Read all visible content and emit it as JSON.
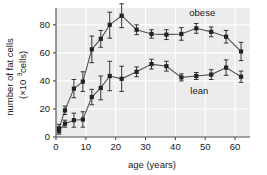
{
  "chart_data": {
    "type": "line",
    "title": "",
    "xlabel": "age (years)",
    "ylabel_line1": "number of fat cells",
    "ylabel_line2_pre": "(×10",
    "ylabel_line2_sup": "9",
    "ylabel_line2_post": " cells)",
    "ylabel_full": "number of fat cells (×10⁹ cells)",
    "xlim": [
      0,
      65
    ],
    "ylim": [
      0,
      92
    ],
    "xticks": [
      0,
      10,
      20,
      30,
      40,
      50,
      60
    ],
    "yticks": [
      0,
      20,
      40,
      60,
      80
    ],
    "grid": true,
    "legend_position": "inline-annotation",
    "plot_bg": "#ececec",
    "grid_color": "#ffffff",
    "marker_color": "#222222",
    "line_color": "#555555",
    "series": [
      {
        "name": "obese",
        "label": "obese",
        "label_x": 49,
        "label_y": 86,
        "x": [
          1,
          3,
          6,
          9,
          12,
          15,
          18,
          22,
          27,
          32,
          37,
          42,
          47,
          52,
          57,
          62
        ],
        "values": [
          6,
          19,
          34.5,
          39.5,
          62.5,
          70,
          80,
          86.5,
          76.5,
          73.5,
          73,
          73.5,
          77.5,
          75,
          71.5,
          61
        ],
        "err_low": [
          3,
          3,
          6.5,
          7,
          9.5,
          6,
          9.5,
          8.5,
          3.5,
          3,
          3.5,
          4.5,
          3.5,
          3.5,
          4.5,
          6.5
        ],
        "err_high": [
          3,
          3,
          6.5,
          7,
          9.5,
          6,
          9,
          8.5,
          3.5,
          3,
          3.5,
          4.5,
          3.5,
          3.5,
          4.5,
          6.5
        ]
      },
      {
        "name": "lean",
        "label": "lean",
        "label_x": 48,
        "label_y": 31,
        "x": [
          1,
          3,
          6,
          9,
          12,
          15,
          18,
          22,
          27,
          32,
          37,
          42,
          47,
          52,
          57,
          62
        ],
        "values": [
          4.5,
          9.5,
          12,
          12.5,
          28.5,
          35,
          43.5,
          41.5,
          46.5,
          52,
          50.5,
          42.5,
          43.5,
          44.5,
          49.5,
          43
        ],
        "err_low": [
          2.5,
          2.5,
          5,
          5.5,
          5.5,
          8.5,
          10.5,
          9,
          3.5,
          3.5,
          3.5,
          2.5,
          2.5,
          3.5,
          5.5,
          4
        ],
        "err_high": [
          2.5,
          2.5,
          5,
          5.5,
          5.5,
          8.5,
          10.5,
          9,
          3.5,
          3.5,
          3.5,
          2.5,
          2.5,
          3.5,
          5.5,
          4
        ]
      }
    ]
  }
}
